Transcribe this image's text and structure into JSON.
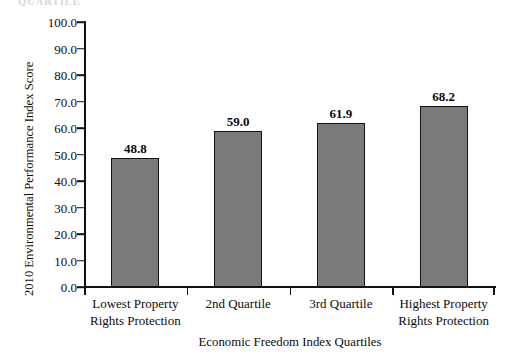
{
  "figure": {
    "background": "#ffffff",
    "top_artifact_text": "QUARTILE",
    "bar_fill_color": "#7b7b7b",
    "bar_border_color": "#121212",
    "axis_color": "#111111",
    "text_color": "#0c0c0c"
  },
  "chart_data": {
    "type": "bar",
    "title": "",
    "subtitle": "",
    "xlabel": "Economic Freedom Index Quartiles",
    "ylabel": "2010 Environmental Performance Index Score",
    "categories": [
      "Lowest Property Rights Protection",
      "2nd Quartile",
      "3rd Quartile",
      "Highest Property Rights Protection"
    ],
    "category_lines": [
      [
        "Lowest Property",
        "Rights Protection"
      ],
      [
        "2nd Quartile",
        ""
      ],
      [
        "3rd Quartile",
        ""
      ],
      [
        "Highest Property",
        "Rights Protection"
      ]
    ],
    "values": [
      48.8,
      59.0,
      61.9,
      68.2
    ],
    "value_labels": [
      "48.8",
      "59.0",
      "61.9",
      "68.2"
    ],
    "ylim": [
      0,
      100
    ],
    "ytick_values": [
      0,
      10,
      20,
      30,
      40,
      50,
      60,
      70,
      80,
      90,
      100
    ],
    "ytick_labels": [
      "0.0",
      "10.0",
      "20.0",
      "30.0",
      "40.0",
      "50.0",
      "60.0",
      "70.0",
      "80.0",
      "90.0",
      "100.0"
    ],
    "grid": false,
    "legend": null,
    "legend_position": "none",
    "annotations": []
  }
}
